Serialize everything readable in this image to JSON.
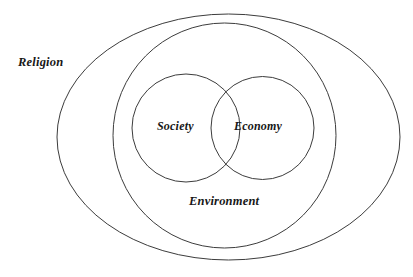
{
  "diagram": {
    "type": "nested-venn",
    "title": "",
    "canvas": {
      "width": 413,
      "height": 277,
      "background": "#ffffff"
    },
    "stroke_color": "#3c3c3c",
    "text_color": "#171717",
    "labels": {
      "religion": "Religion",
      "society": "Society",
      "economy": "Economy",
      "environment": "Environment"
    },
    "shapes": [
      {
        "name": "religion-ellipse",
        "label": "Religion",
        "shape": "ellipse",
        "cx": 228.5,
        "cy": 137,
        "rx": 171.5,
        "ry": 123,
        "level": 1
      },
      {
        "name": "environment-ellipse",
        "label": "Environment",
        "shape": "ellipse",
        "cx": 224.5,
        "cy": 135.5,
        "rx": 111.5,
        "ry": 112.5,
        "level": 2
      },
      {
        "name": "society-circle",
        "label": "Society",
        "shape": "circle",
        "cx": 186,
        "cy": 128,
        "r": 54,
        "level": 3
      },
      {
        "name": "economy-circle",
        "label": "Economy",
        "shape": "circle",
        "cx": 262.5,
        "cy": 128,
        "r": 51.5,
        "level": 3
      }
    ],
    "containment": "Religion contains Environment; Environment contains Society and Economy; Society and Economy overlap."
  }
}
